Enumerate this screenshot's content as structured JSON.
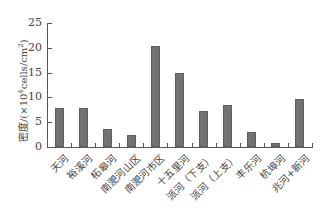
{
  "chart_data": {
    "type": "bar",
    "title": "",
    "xlabel": "",
    "ylabel": "密度/(×10⁴cells/cm²)",
    "ylabel_parts": {
      "prefix": "密度/(×10",
      "exp": "4",
      "mid": "cells/cm",
      "exp2": "2",
      "suffix": ")"
    },
    "ylim": [
      0,
      25
    ],
    "yticks": [
      0,
      5,
      10,
      15,
      20,
      25
    ],
    "grid": false,
    "legend": null,
    "categories": [
      "天河",
      "裕溪河",
      "柘皋河",
      "南淝河山区",
      "南淝河市区",
      "十五里河",
      "派河（下支）",
      "派河（上支）",
      "丰乐河",
      "杭埠河",
      "兆河+新河"
    ],
    "values": [
      7.9,
      7.9,
      3.6,
      2.4,
      20.3,
      14.9,
      7.3,
      8.5,
      3.1,
      0.8,
      9.7
    ],
    "bar_color": "#727272"
  }
}
